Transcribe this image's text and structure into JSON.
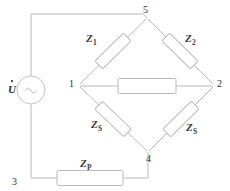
{
  "diagram": {
    "type": "electrical-schematic",
    "colors": {
      "wire": "#b9b9b9",
      "component_outline": "#b9b9b9",
      "component_fill": "#ffffff",
      "text": "#3a3a3a",
      "background": "#ffffff"
    }
  },
  "source": {
    "name": "voltage-source",
    "label": "U",
    "phasor_dot": true,
    "symbol": "sine-wave",
    "symbol_glyph": "~"
  },
  "nodes": [
    {
      "id": "n1",
      "label": "1",
      "x": 78,
      "y": 85
    },
    {
      "id": "n2",
      "label": "2",
      "x": 216,
      "y": 85
    },
    {
      "id": "n3",
      "label": "3",
      "x": 12,
      "y": 180
    },
    {
      "id": "n4",
      "label": "4",
      "x": 148,
      "y": 157
    },
    {
      "id": "n5",
      "label": "5",
      "x": 148,
      "y": 11
    }
  ],
  "components": [
    {
      "id": "z1",
      "label": "Z",
      "subscript": "1",
      "branch": "node-1-to-node-5",
      "position": "upper-left"
    },
    {
      "id": "z2",
      "label": "Z",
      "subscript": "2",
      "branch": "node-5-to-node-2",
      "position": "upper-right"
    },
    {
      "id": "zs_left",
      "label": "Z",
      "subscript": "S",
      "branch": "node-1-to-node-4",
      "position": "lower-left"
    },
    {
      "id": "zs_right",
      "label": "Z",
      "subscript": "S",
      "branch": "node-4-to-node-2",
      "position": "lower-right"
    },
    {
      "id": "zp",
      "label": "Z",
      "subscript": "P",
      "branch": "node-3-to-node-4",
      "position": "bottom"
    },
    {
      "id": "bridge",
      "label": "",
      "subscript": "",
      "branch": "node-1-to-node-2",
      "position": "center-horizontal"
    }
  ]
}
